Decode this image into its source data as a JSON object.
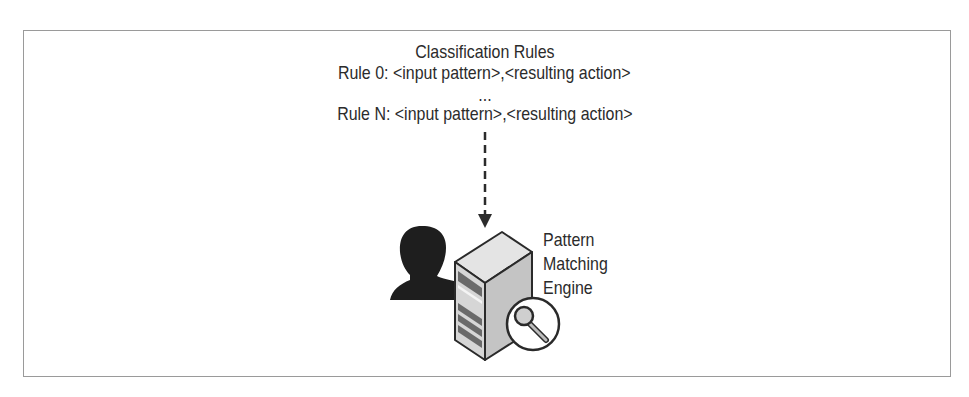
{
  "diagram": {
    "title": "Classification Rules",
    "rules": [
      "Rule 0: <input pattern>,<resulting action>",
      "...",
      "Rule N: <input pattern>,<resulting action>"
    ],
    "engine_label": [
      "Pattern",
      "Matching",
      "Engine"
    ],
    "icons": {
      "user": "user-silhouette-icon",
      "server": "server-icon",
      "search": "magnifier-icon",
      "arrow": "dashed-arrow-down"
    },
    "colors": {
      "border": "#9a9a9a",
      "text": "#2b2b2b",
      "silhouette": "#1e1e1e",
      "server_face": "#d4d4d4",
      "server_side": "#c2c2c2",
      "server_top": "#e6e6e6"
    }
  }
}
